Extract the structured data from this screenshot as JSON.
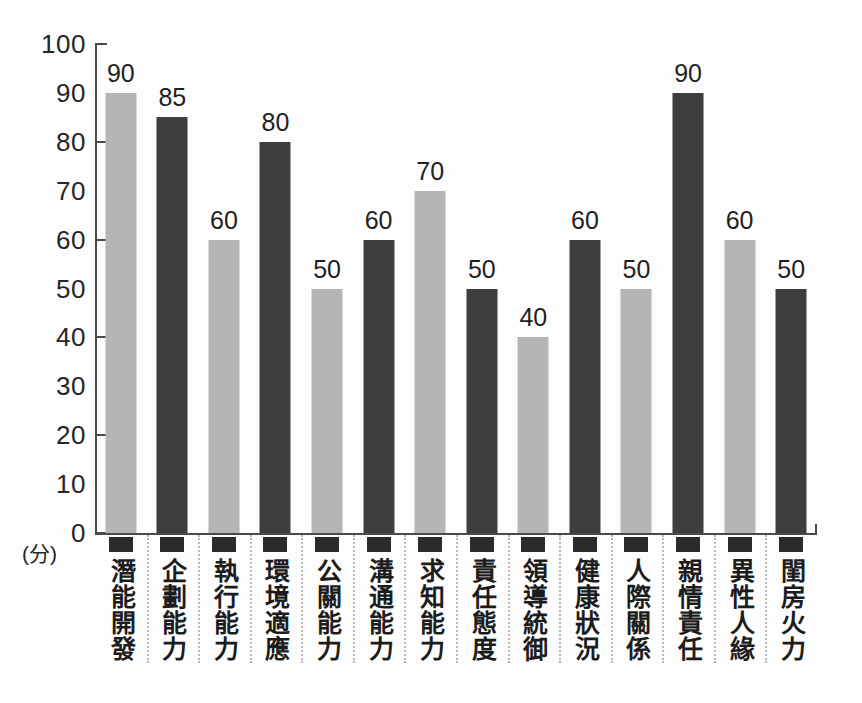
{
  "chart_data": {
    "type": "bar",
    "title": "",
    "xlabel": "",
    "ylabel": "(分)",
    "ylim": [
      0,
      100
    ],
    "grid": false,
    "legend": "none",
    "y_tick_labels": [
      "100",
      "90",
      "80",
      "70",
      "60",
      "50",
      "40",
      "30",
      "20",
      "10",
      "0"
    ],
    "y_major_ticks": [
      100,
      80,
      60,
      40,
      20,
      0
    ],
    "categories": [
      "潛能開發",
      "企劃能力",
      "執行能力",
      "環境適應",
      "公關能力",
      "溝通能力",
      "求知能力",
      "責任態度",
      "領導統御",
      "健康狀況",
      "人際關係",
      "親情責任",
      "異性人緣",
      "閨房火力"
    ],
    "values": [
      90,
      85,
      60,
      80,
      50,
      60,
      70,
      50,
      40,
      60,
      50,
      90,
      60,
      50
    ],
    "bar_styles": [
      "light",
      "dark",
      "light",
      "dark",
      "light",
      "dark",
      "light",
      "dark",
      "light",
      "dark",
      "light",
      "dark",
      "light",
      "dark"
    ],
    "colors": {
      "light_bar": "#b5b5b5",
      "dark_bar": "#3e3e3e",
      "axis": "#4a4a4a",
      "text": "#1f1f1f",
      "separator": "#b9b9b9",
      "background": "#fdfdfd"
    }
  }
}
